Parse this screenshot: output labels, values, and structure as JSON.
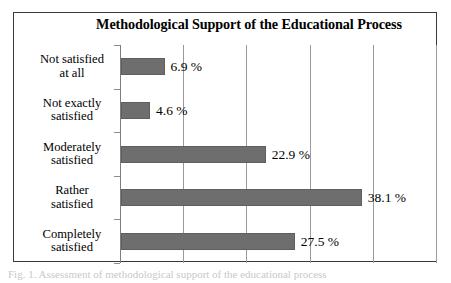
{
  "figure": {
    "caption_fragment": "Fig. 1. Assessment of methodological support of the educational process"
  },
  "chart_data": {
    "type": "bar",
    "orientation": "horizontal",
    "title": "Methodological Support of the Educational Process",
    "xlabel": "",
    "ylabel": "",
    "categories": [
      "Not satisfied at all",
      "Not exactly satisfied",
      "Moderately satisfied",
      "Rather satisfied",
      "Completely satisfied"
    ],
    "category_lines": [
      [
        "Not satisfied",
        "at all"
      ],
      [
        "Not exactly",
        "satisfied"
      ],
      [
        "Moderately",
        "satisfied"
      ],
      [
        "Rather",
        "satisfied"
      ],
      [
        "Completely",
        "satisfied"
      ]
    ],
    "values": [
      6.9,
      4.6,
      22.9,
      38.1,
      27.5
    ],
    "value_labels": [
      "6.9 %",
      "4.6 %",
      "22.9 %",
      "38.1 %",
      "27.5 %"
    ],
    "xlim": [
      0,
      50
    ],
    "xticks": [
      0,
      10,
      20,
      30,
      40,
      50
    ],
    "xtick_labels": [
      "",
      "",
      "",
      "",
      "",
      ""
    ],
    "grid": true,
    "grid_axis": "x",
    "legend": false,
    "bar_color": "#6e6e6e",
    "grid_color": "#9a9a9a",
    "frame_color": "#3a3a3a",
    "text_color": "#000000"
  }
}
